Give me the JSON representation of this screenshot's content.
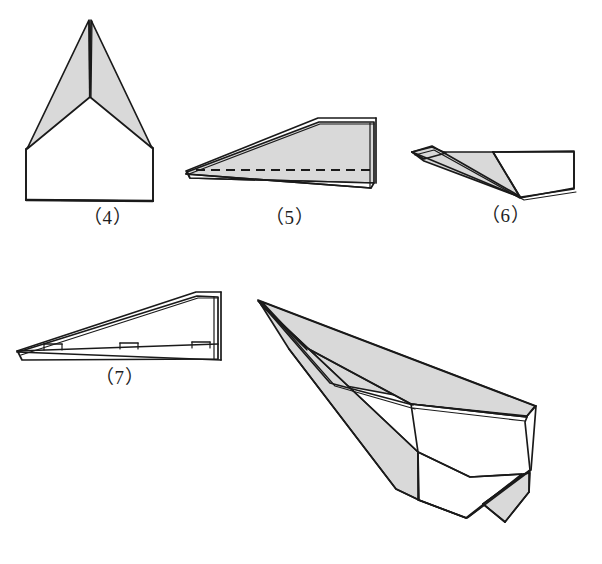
{
  "page": {
    "kind": "origami-instruction-illustration",
    "background_color": "#ffffff",
    "ink_color": "#1a1a1a",
    "shaded_face_color": "#d9d9d9",
    "width": 602,
    "height": 564
  },
  "figures": [
    {
      "id": "step-4",
      "label": "（4）",
      "caption_number": "4",
      "description": "front view of folded sheet: two shaded wing triangles meeting at a central vertical crease above a plain rectangular body",
      "label_position": {
        "x": 83,
        "y": 208
      }
    },
    {
      "id": "step-5",
      "label": "（5）",
      "caption_number": "5",
      "description": "side view of long narrow wedge with shaded top face, nose pointing left, dashed fold line running along the body",
      "has_dashed_fold_line": true,
      "label_position": {
        "x": 265,
        "y": 208
      }
    },
    {
      "id": "step-6",
      "label": "（6）",
      "caption_number": "6",
      "description": "side view after wings are folded down, shaded triangular wing panel visible near the nose at left",
      "label_position": {
        "x": 481,
        "y": 206
      }
    },
    {
      "id": "step-7",
      "label": "（7）",
      "caption_number": "7",
      "description": "side view of finished glider profile with three small staple/clip marks along the lower fuselage seam",
      "staple_marks": 3,
      "label_position": {
        "x": 95,
        "y": 368
      }
    },
    {
      "id": "final-model",
      "label": "",
      "caption_number": "",
      "description": "large three-quarter perspective view of the completed dart paper airplane, nose at upper left, swept shaded wings and a folded vertical fin at the tail",
      "label_position": null
    }
  ]
}
